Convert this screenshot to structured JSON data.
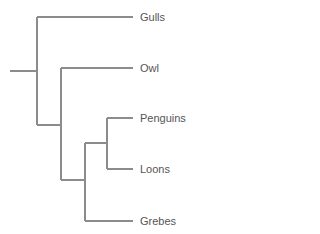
{
  "diagram": {
    "type": "phylogenetic-tree (cladogram)",
    "line_color": "#8c8c8c",
    "text_color": "#555555",
    "taxa": [
      {
        "label": "Gulls",
        "y": 17
      },
      {
        "label": "Owl",
        "y": 68
      },
      {
        "label": "Penguins",
        "y": 118
      },
      {
        "label": "Loons",
        "y": 169
      },
      {
        "label": "Grebes",
        "y": 221
      }
    ],
    "topology": "((Gulls),(Owl,((Penguins,Loons),Grebes)))"
  }
}
